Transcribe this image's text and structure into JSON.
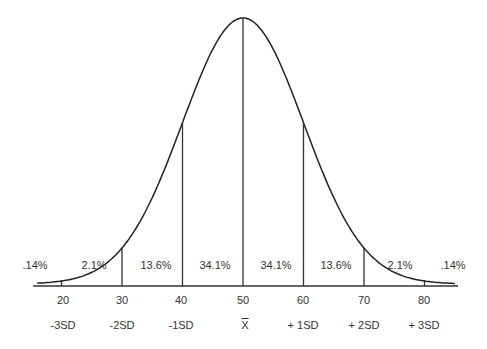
{
  "chart_data": {
    "type": "line",
    "x": [
      20,
      30,
      40,
      50,
      60,
      70,
      80
    ],
    "tick_labels": [
      "20",
      "30",
      "40",
      "50",
      "60",
      "70",
      "80"
    ],
    "sd_labels": [
      "-3SD",
      "-2SD",
      "-1SD",
      "X",
      "+ 1SD",
      "+ 2SD",
      "+ 3SD"
    ],
    "regions": [
      {
        "range": "< -3SD",
        "percent": ".14%"
      },
      {
        "range": "-3SD to -2SD",
        "percent": "2.1%"
      },
      {
        "range": "-2SD to -1SD",
        "percent": "13.6%"
      },
      {
        "range": "-1SD to mean",
        "percent": "34.1%"
      },
      {
        "range": "mean to +1SD",
        "percent": "34.1%"
      },
      {
        "range": "+1SD to +2SD",
        "percent": "13.6%"
      },
      {
        "range": "+2SD to +3SD",
        "percent": "2.1%"
      },
      {
        "range": "> +3SD",
        "percent": ".14%"
      }
    ],
    "mean": 50,
    "sd": 10,
    "xlabel": "",
    "ylabel": "",
    "grid": false,
    "legend": "none"
  }
}
